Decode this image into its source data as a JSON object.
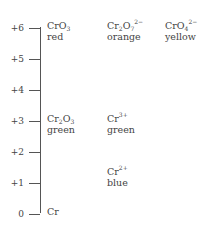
{
  "axis": {
    "ticks": [
      {
        "value": 6,
        "label": "+6"
      },
      {
        "value": 5,
        "label": "+5"
      },
      {
        "value": 4,
        "label": "+4"
      },
      {
        "value": 3,
        "label": "+3"
      },
      {
        "value": 2,
        "label": "+2"
      },
      {
        "value": 1,
        "label": "+1"
      },
      {
        "value": 0,
        "label": "0"
      }
    ],
    "min": 0,
    "max": 6
  },
  "species": [
    {
      "state": 6,
      "column": 0,
      "row": 0,
      "base": "CrO",
      "sub": "3",
      "base2": "",
      "sub2": "",
      "sup": "",
      "color": "red"
    },
    {
      "state": 6,
      "column": 1,
      "row": 0,
      "base": "Cr",
      "sub": "2",
      "base2": "O",
      "sub2": "7",
      "sup": "2−",
      "color": "orange"
    },
    {
      "state": 6,
      "column": 2,
      "row": 0,
      "base": "CrO",
      "sub": "4",
      "base2": "",
      "sub2": "",
      "sup": "2−",
      "color": "yellow"
    },
    {
      "state": 3,
      "column": 0,
      "row": 0,
      "base": "Cr",
      "sub": "2",
      "base2": "O",
      "sub2": "3",
      "sup": "",
      "color": "green"
    },
    {
      "state": 3,
      "column": 1,
      "row": 0,
      "base": "Cr",
      "sub": "",
      "base2": "",
      "sub2": "",
      "sup": "3+",
      "color": "green"
    },
    {
      "state": 2,
      "column": 1,
      "row": 1,
      "base": "Cr",
      "sub": "",
      "base2": "",
      "sub2": "",
      "sup": "2+",
      "color": "blue"
    },
    {
      "state": 0,
      "column": 0,
      "row": 0,
      "base": "Cr",
      "sub": "",
      "base2": "",
      "sub2": "",
      "sup": "",
      "color": ""
    }
  ]
}
